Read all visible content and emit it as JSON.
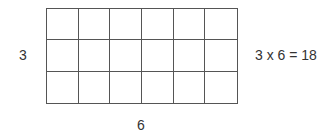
{
  "diagram": {
    "rows": 3,
    "columns": 6,
    "row_label": "3",
    "column_label": "6",
    "equation": "3 x 6 = 18",
    "product": 18
  }
}
